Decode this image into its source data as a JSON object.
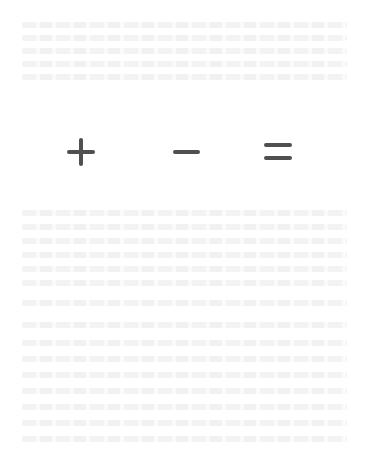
{
  "header": {
    "clipped_text": "WISE FAST FOR ANSWER"
  },
  "puzzle": {
    "type": "matchstick-equation",
    "equation_shown": "8 + 3 - 2 = 8",
    "colors": {
      "stick_on": "#505050",
      "stick_faint": "#e6e6e6",
      "background": "#ffffff"
    },
    "digits": [
      {
        "value": "8",
        "segments": {
          "a": "on",
          "b": "on",
          "c": "on",
          "d": "on",
          "e": "on",
          "f": "on",
          "g": "on"
        }
      },
      {
        "value": "3",
        "segments": {
          "a": "on",
          "b": "on",
          "c": "on",
          "d": "on",
          "e": "off",
          "f": "off",
          "g": "on"
        }
      },
      {
        "value": "2",
        "segments": {
          "a": "on",
          "b": "on",
          "c": "off",
          "d": "on",
          "e": "on",
          "f": "off",
          "g": "on"
        }
      },
      {
        "value": "8",
        "segments": {
          "a": "on",
          "b": "on",
          "c": "on",
          "d": "on",
          "e": "on",
          "f": "on",
          "g": "on"
        }
      }
    ],
    "operators": [
      "+",
      "-",
      "="
    ]
  }
}
